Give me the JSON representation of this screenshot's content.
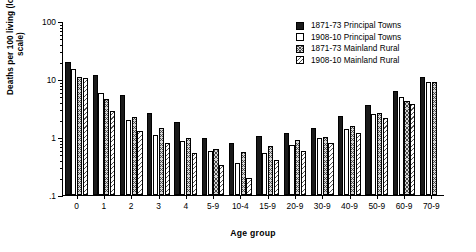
{
  "chart_data": {
    "type": "bar",
    "title": "",
    "xlabel": "Age group",
    "ylabel": "Deaths per 100 living (log scale)",
    "yscale": "log",
    "ylim": [
      0.1,
      100
    ],
    "ytick_labels": [
      "100",
      "10",
      "1",
      ".1"
    ],
    "ytick_values": [
      100,
      10,
      1,
      0.1
    ],
    "grid": false,
    "legend_position": "top-right",
    "categories": [
      "0",
      "1",
      "2",
      "3",
      "4",
      "5-9",
      "10-4",
      "15-9",
      "20-9",
      "30-9",
      "40-9",
      "50-9",
      "60-9",
      "70-9"
    ],
    "series": [
      {
        "name": "1871-73 Principal Towns",
        "swatch": "s0",
        "color": "#1a1a1a",
        "values": [
          20.0,
          11.5,
          5.2,
          2.6,
          1.85,
          0.95,
          0.78,
          1.05,
          1.15,
          1.45,
          2.3,
          3.6,
          6.3,
          11.0
        ]
      },
      {
        "name": "1908-10 Principal Towns",
        "swatch": "s1",
        "color": "#ffffff",
        "values": [
          15.0,
          5.7,
          2.0,
          1.1,
          0.85,
          0.58,
          0.35,
          0.52,
          0.72,
          0.95,
          1.35,
          2.5,
          4.9,
          9.0
        ]
      },
      {
        "name": "1871-73 Mainland Rural",
        "swatch": "s2",
        "color": "#d8d8d8",
        "values": [
          10.8,
          4.6,
          2.2,
          1.45,
          0.98,
          0.62,
          0.55,
          0.7,
          0.9,
          1.0,
          1.55,
          2.6,
          4.2,
          8.9
        ]
      },
      {
        "name": "1908-10 Mainland Rural",
        "swatch": "s3",
        "color": "#ffffff",
        "values": [
          10.5,
          2.8,
          1.25,
          0.78,
          0.52,
          0.33,
          0.2,
          0.4,
          0.58,
          0.78,
          1.15,
          2.1,
          3.7,
          null
        ]
      }
    ]
  }
}
